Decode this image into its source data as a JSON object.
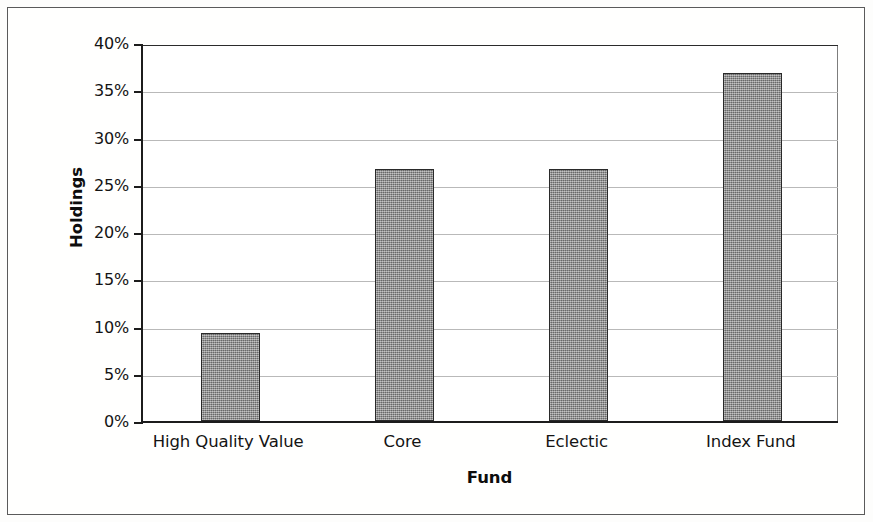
{
  "chart_data": {
    "type": "bar",
    "title": "",
    "xlabel": "Fund",
    "ylabel": "Holdings",
    "categories": [
      "High Quality Value",
      "Core",
      "Eclectic",
      "Index Fund"
    ],
    "values": [
      9.3,
      26.7,
      26.7,
      36.8
    ],
    "value_labels": [
      "9.3%",
      "26.7%",
      "26.7%",
      "36.8%"
    ],
    "ylim": [
      0,
      40
    ],
    "ytick_values": [
      0,
      5,
      10,
      15,
      20,
      25,
      30,
      35,
      40
    ],
    "ytick_labels": [
      "0%",
      "5%",
      "10%",
      "15%",
      "20%",
      "25%",
      "30%",
      "35%",
      "40%"
    ],
    "grid": true,
    "grid_axis": "y",
    "legend": false,
    "legend_position": "none",
    "bar_fill_color": "#8a8a8a",
    "bar_edge_color": "#2a2a2a",
    "gridline_color": "#b9b9b9",
    "axis_color": "#1c1c1c",
    "background_color": "#ffffff",
    "frame_color": "#5a5a5a"
  }
}
